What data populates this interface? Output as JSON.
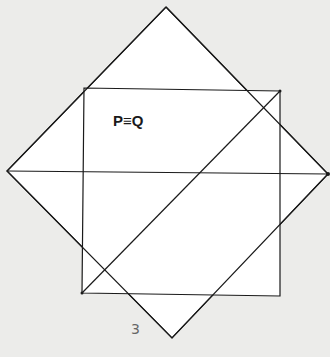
{
  "diagram": {
    "label_main": "P≡Q",
    "figure_number": "3",
    "shapes": {
      "square_rotated": {
        "top": [
          166,
          7
        ],
        "right": [
          328,
          174
        ],
        "bottom": [
          172,
          338
        ],
        "left": [
          7,
          171
        ]
      },
      "rectangle": {
        "tl": [
          84,
          88
        ],
        "tr": [
          280,
          91
        ],
        "br": [
          280,
          296
        ],
        "bl": [
          82,
          293
        ]
      },
      "horizontal_line": {
        "from": [
          7,
          171
        ],
        "to": [
          328,
          174
        ]
      },
      "diagonal_line": {
        "from": [
          82,
          293
        ],
        "to": [
          280,
          91
        ]
      }
    },
    "colors": {
      "background": "#ececea",
      "fill": "#ffffff",
      "stroke": "#1a1a1a"
    }
  }
}
